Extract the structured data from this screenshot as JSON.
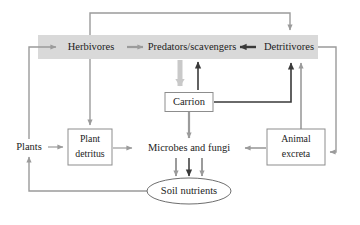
{
  "diagram": {
    "colors": {
      "band": "#d9d9d9",
      "light_arrow": "#9b9b9b",
      "dark_arrow": "#3a3a3a",
      "pale_arrow": "#c9c9c9",
      "box_stroke": "#8d8d8d",
      "text": "#1c1c1c",
      "background": "#ffffff"
    },
    "band": {
      "name": "consumer-band",
      "x": 38,
      "y": 35,
      "width": 280,
      "height": 24
    },
    "nodes": [
      {
        "id": "herbivores",
        "label": "Herbivores",
        "shape": "plain",
        "cx": 91,
        "cy": 47
      },
      {
        "id": "predators",
        "label": "Predators/scavengers",
        "shape": "plain",
        "cx": 192,
        "cy": 47
      },
      {
        "id": "detritivores",
        "label": "Detritivores",
        "shape": "plain",
        "cx": 289,
        "cy": 47
      },
      {
        "id": "carrion",
        "label": "Carrion",
        "shape": "box",
        "cx": 189,
        "cy": 102,
        "width": 48,
        "height": 19
      },
      {
        "id": "plants",
        "label": "Plants",
        "shape": "plain",
        "cx": 29,
        "cy": 147
      },
      {
        "id": "plant-detritus",
        "label_line1": "Plant",
        "label_line2": "detritus",
        "shape": "box",
        "cx": 90,
        "cy": 147,
        "width": 44,
        "height": 36
      },
      {
        "id": "microbes",
        "label": "Microbes and fungi",
        "shape": "plain",
        "cx": 189,
        "cy": 148
      },
      {
        "id": "animal-excreta",
        "label_line1": "Animal",
        "label_line2": "excreta",
        "shape": "box",
        "cx": 296,
        "cy": 147,
        "width": 58,
        "height": 36
      },
      {
        "id": "soil-nutrients",
        "label": "Soil nutrients",
        "shape": "ellipse",
        "cx": 189,
        "cy": 191,
        "rx": 42,
        "ry": 13
      }
    ],
    "edges": [
      {
        "id": "plants-to-herbivores",
        "from": "plants",
        "to": "herbivores",
        "style": "light"
      },
      {
        "id": "herbivores-to-predators",
        "from": "herbivores",
        "to": "predators",
        "style": "light"
      },
      {
        "id": "detritivores-to-predators",
        "from": "detritivores",
        "to": "predators",
        "style": "dark"
      },
      {
        "id": "herbivores-to-detritivores",
        "from": "herbivores",
        "to": "detritivores",
        "style": "light"
      },
      {
        "id": "herbivores-to-plant-detritus",
        "from": "herbivores",
        "to": "plant-detritus",
        "style": "light"
      },
      {
        "id": "predators-to-carrion",
        "from": "predators",
        "to": "carrion",
        "style": "pale"
      },
      {
        "id": "carrion-to-predators",
        "from": "carrion",
        "to": "predators",
        "style": "dark"
      },
      {
        "id": "carrion-to-detritivores",
        "from": "carrion",
        "to": "detritivores",
        "style": "dark"
      },
      {
        "id": "carrion-to-microbes",
        "from": "carrion",
        "to": "microbes",
        "style": "light"
      },
      {
        "id": "plants-to-plant-detritus",
        "from": "plants",
        "to": "plant-detritus",
        "style": "light"
      },
      {
        "id": "plant-detritus-to-microbes",
        "from": "plant-detritus",
        "to": "microbes",
        "style": "light"
      },
      {
        "id": "animal-excreta-to-microbes",
        "from": "animal-excreta",
        "to": "microbes",
        "style": "light"
      },
      {
        "id": "animal-excreta-to-detritivores",
        "from": "animal-excreta",
        "to": "detritivores",
        "style": "light"
      },
      {
        "id": "detritivores-to-animal-excreta",
        "from": "detritivores",
        "to": "animal-excreta",
        "style": "light"
      },
      {
        "id": "microbes-to-soil-nutrients-1",
        "from": "microbes",
        "to": "soil-nutrients",
        "style": "light"
      },
      {
        "id": "microbes-to-soil-nutrients-2",
        "from": "microbes",
        "to": "soil-nutrients",
        "style": "dark"
      },
      {
        "id": "microbes-to-soil-nutrients-3",
        "from": "microbes",
        "to": "soil-nutrients",
        "style": "light"
      },
      {
        "id": "soil-nutrients-to-plants",
        "from": "soil-nutrients",
        "to": "plants",
        "style": "light"
      }
    ]
  }
}
